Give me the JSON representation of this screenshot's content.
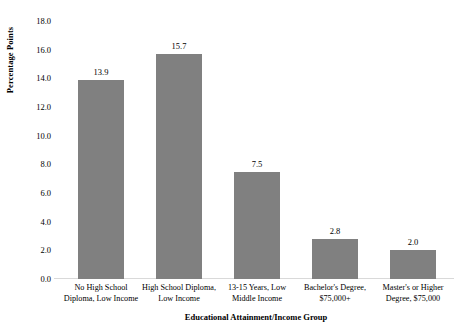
{
  "chart_data": {
    "type": "bar",
    "title": "",
    "subtitle": "",
    "xlabel": "Educational Attainment/Income Group",
    "ylabel": "Percentage Points",
    "categories": [
      "No High School Diploma, Low Income",
      "High School Diploma, Low Income",
      "13-15 Years, Low Middle Income",
      "Bachelor's Degree, $75,000+",
      "Master's or Higher Degree, $75,000"
    ],
    "category_lines": [
      [
        "No High School",
        "Diploma, Low Income"
      ],
      [
        "High School Diploma,",
        "Low Income"
      ],
      [
        "13-15 Years, Low",
        "Middle Income"
      ],
      [
        "Bachelor's Degree,",
        "$75,000+"
      ],
      [
        "Master's or Higher",
        "Degree, $75,000"
      ]
    ],
    "values": [
      13.9,
      15.7,
      7.5,
      2.8,
      2.0
    ],
    "value_labels": [
      "13.9",
      "15.7",
      "7.5",
      "2.8",
      "2.0"
    ],
    "ylim": [
      0.0,
      18.0
    ],
    "ytick_values": [
      0.0,
      2.0,
      4.0,
      6.0,
      8.0,
      10.0,
      12.0,
      14.0,
      16.0,
      18.0
    ],
    "ytick_labels": [
      "0.0",
      "2.0",
      "4.0",
      "6.0",
      "8.0",
      "10.0",
      "12.0",
      "14.0",
      "16.0",
      "18.0"
    ],
    "grid": false,
    "legend": null,
    "legend_position": "none",
    "bar_color": "#808080",
    "background_color": "#ffffff",
    "axis_color": "#d9d9d9",
    "text_color": "#000000"
  }
}
